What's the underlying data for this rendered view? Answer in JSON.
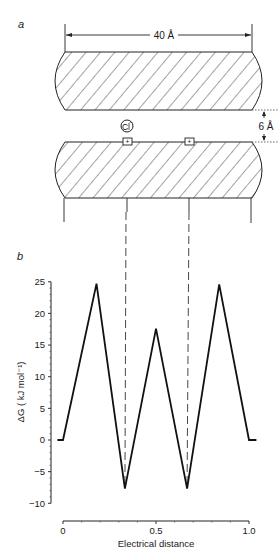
{
  "figure": {
    "panel_a": {
      "label": "a",
      "width_dimension": "40 Å",
      "gap_dimension": "6 Å",
      "ion_label": "Cl",
      "ion_charge": "−",
      "site_charge": "+",
      "site_count": 2
    },
    "panel_b": {
      "label": "b"
    }
  },
  "chart_data": {
    "type": "line",
    "title": "",
    "xlabel": "Electrical distance",
    "ylabel": "ΔG ( kJ mol⁻¹)",
    "xlim": [
      0,
      1.0
    ],
    "ylim": [
      -10,
      25
    ],
    "x_ticks": [
      0,
      0.5,
      1.0
    ],
    "x_tick_labels": [
      "0",
      "0.5",
      "1.0"
    ],
    "y_ticks": [
      25,
      20,
      15,
      10,
      5,
      0,
      -5,
      -10
    ],
    "y_tick_labels": [
      "25",
      "20",
      "15",
      "10",
      "5",
      "0",
      "−5",
      "−10"
    ],
    "grid": false,
    "legend": null,
    "series": [
      {
        "name": "Energy profile",
        "x": [
          -0.03,
          0.0,
          0.18,
          0.333,
          0.5,
          0.667,
          0.84,
          1.0,
          1.04
        ],
        "y": [
          0,
          0,
          24.7,
          -7.7,
          17.6,
          -7.7,
          24.6,
          0,
          0
        ]
      }
    ],
    "annotations": [
      {
        "type": "dashed-vertical",
        "x": 0.333,
        "label": "binding site 1"
      },
      {
        "type": "dashed-vertical",
        "x": 0.667,
        "label": "binding site 2"
      }
    ]
  }
}
